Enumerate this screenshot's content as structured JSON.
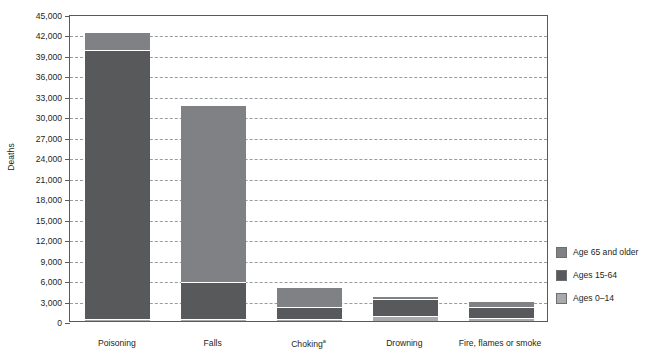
{
  "chart_data": {
    "type": "bar",
    "subtype": "stacked-vertical",
    "title": "",
    "xlabel": "",
    "ylabel": "Deaths",
    "ylim": [
      0,
      45000
    ],
    "ytick_step": 3000,
    "ytick_labels": [
      "0",
      "3,000",
      "6,000",
      "9,000",
      "12,000",
      "15,000",
      "18,000",
      "21,000",
      "24,000",
      "27,000",
      "30,000",
      "33,000",
      "36,000",
      "39,000",
      "42,000",
      "45,000"
    ],
    "ytick_values": [
      0,
      3000,
      6000,
      9000,
      12000,
      15000,
      18000,
      21000,
      24000,
      27000,
      30000,
      33000,
      36000,
      39000,
      42000,
      45000
    ],
    "grid": true,
    "grid_style": "dashed-horizontal",
    "legend_position": "right",
    "categories": [
      "Poisoning",
      "Falls",
      "Choking",
      "Drowning",
      "Fire, flames or smoke"
    ],
    "category_footnotes": [
      "",
      "",
      "a",
      "",
      ""
    ],
    "series": [
      {
        "name": "Ages 0–14",
        "color": "#a7a9ac",
        "values": [
          150,
          150,
          200,
          700,
          400
        ]
      },
      {
        "name": "Ages 15-64",
        "color": "#58595b",
        "values": [
          39600,
          5400,
          1700,
          2500,
          1500
        ]
      },
      {
        "name": "Age 65 and older",
        "color": "#808184",
        "values": [
          2450,
          26000,
          2900,
          250,
          850
        ]
      }
    ],
    "stack_order_bottom_to_top": [
      "Ages 0–14",
      "Ages 15-64",
      "Age 65 and older"
    ],
    "totals": [
      42200,
      31550,
      4800,
      3450,
      2750
    ]
  },
  "legend": {
    "items": [
      {
        "label": "Age 65 and older",
        "color": "#808184"
      },
      {
        "label": "Ages 15-64",
        "color": "#58595b"
      },
      {
        "label": "Ages 0–14",
        "color": "#a7a9ac"
      }
    ]
  },
  "colors": {
    "axis": "#58595b",
    "grid": "#9a9b9e",
    "text": "#231f20",
    "background": "#ffffff",
    "series_65_plus": "#808184",
    "series_15_64": "#58595b",
    "series_0_14": "#a7a9ac"
  }
}
